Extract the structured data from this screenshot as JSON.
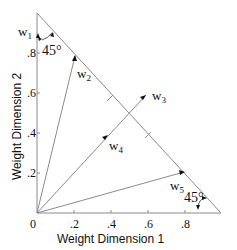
{
  "axes": {
    "xlabel": "Weight Dimension 1",
    "ylabel": "Weight Dimension 2",
    "origin_label": "0",
    "xticks": [
      ".2",
      ".4",
      ".6",
      ".8"
    ],
    "yticks": [
      ".2",
      ".4",
      ".6",
      ".8"
    ]
  },
  "vectors": {
    "w1": {
      "base": "w",
      "sub": "1"
    },
    "w2": {
      "base": "w",
      "sub": "2"
    },
    "w3": {
      "base": "w",
      "sub": "3"
    },
    "w4": {
      "base": "w",
      "sub": "4"
    },
    "w5": {
      "base": "w",
      "sub": "5"
    }
  },
  "angles": {
    "top": "45°",
    "bottom": "45°"
  },
  "colors": {
    "line": "#8a8a8a",
    "text": "#111111"
  }
}
